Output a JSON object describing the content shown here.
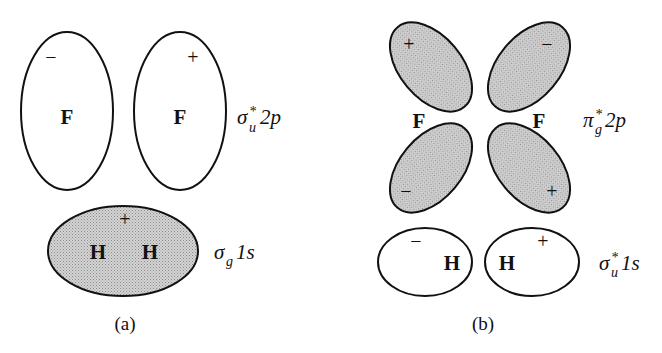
{
  "figure": {
    "panel_a": {
      "caption": "(a)",
      "f_orbital": {
        "label_main": "σ",
        "label_sub": "u",
        "label_sup": "*",
        "label_rest": "2p",
        "lobes": [
          {
            "atom": "F",
            "sign": "−",
            "shaded": false
          },
          {
            "atom": "F",
            "sign": "+",
            "shaded": false
          }
        ]
      },
      "h_orbital": {
        "label_main": "σ",
        "label_sub": "g",
        "label_rest": "1s",
        "atoms": [
          "H",
          "H"
        ],
        "sign": "+",
        "shaded": true
      }
    },
    "panel_b": {
      "caption": "(b)",
      "f_orbital": {
        "label_main": "π",
        "label_sub": "g",
        "label_sup": "*",
        "label_rest": "2p",
        "atoms": [
          "F",
          "F"
        ],
        "lobes": [
          {
            "position": "top-left",
            "sign": "+",
            "shaded": true
          },
          {
            "position": "top-right",
            "sign": "−",
            "shaded": true
          },
          {
            "position": "bottom-left",
            "sign": "−",
            "shaded": true
          },
          {
            "position": "bottom-right",
            "sign": "+",
            "shaded": true
          }
        ]
      },
      "h_orbital": {
        "label_main": "σ",
        "label_sub": "u",
        "label_sup": "*",
        "label_rest": "1s",
        "lobes": [
          {
            "atom": "H",
            "sign": "−",
            "shaded": false
          },
          {
            "atom": "H",
            "sign": "+",
            "shaded": false
          }
        ]
      }
    },
    "colors": {
      "shaded_fill": "#c9c9c9",
      "outline": "#111111",
      "background": "#ffffff"
    }
  }
}
